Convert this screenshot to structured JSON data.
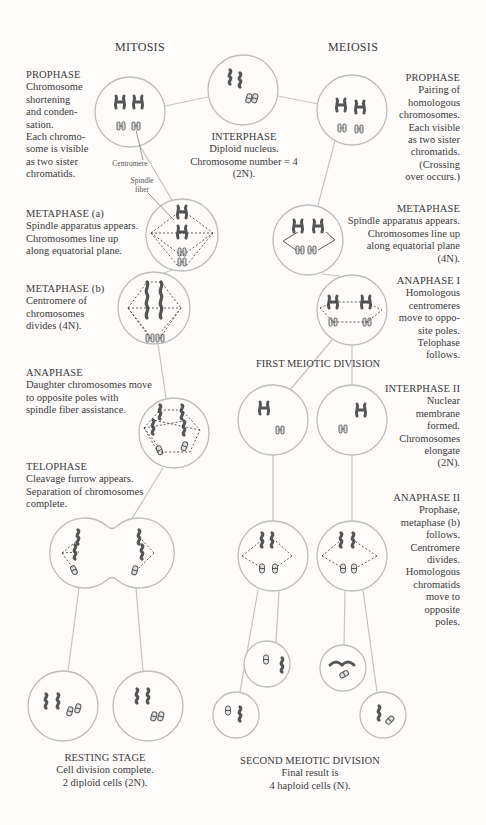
{
  "titles": {
    "mitosis": "MITOSIS",
    "meiosis": "MEIOSIS"
  },
  "interphase": {
    "heading": "INTERPHASE",
    "lines": [
      "Diploid nucleus.",
      "Chromosome number = 4",
      "(2N)."
    ]
  },
  "mitosis": {
    "prophase": {
      "heading": "PROPHASE",
      "lines": [
        "Chromosome",
        "shortening",
        "and conden-",
        "sation.",
        "Each chromo-",
        "some is visible",
        "as two sister",
        "chromatids."
      ]
    },
    "labels": {
      "centromere": "Centromere",
      "spindle_1": "Spindle",
      "spindle_2": "fiber"
    },
    "metaphase_a": {
      "heading": "METAPHASE (a)",
      "lines": [
        "Spindle apparatus appears.",
        "Chromosomes line up",
        "along equatorial plane."
      ]
    },
    "metaphase_b": {
      "heading": "METAPHASE (b)",
      "lines": [
        "Centromere of",
        "chromosomes",
        "divides (4N)."
      ]
    },
    "anaphase": {
      "heading": "ANAPHASE",
      "lines": [
        "Daughter chromosomes move",
        "to opposite poles with",
        "spindle fiber assistance."
      ]
    },
    "telophase": {
      "heading": "TELOPHASE",
      "lines": [
        "Cleavage furrow appears.",
        "Separation of chromosomes",
        "complete."
      ]
    },
    "resting": {
      "heading": "RESTING STAGE",
      "lines": [
        "Cell division complete.",
        "2 diploid cells (2N)."
      ]
    }
  },
  "meiosis": {
    "prophase": {
      "heading": "PROPHASE",
      "lines": [
        "Pairing of",
        "homologous",
        "chromosomes.",
        "Each visible",
        "as two sister",
        "chromatids.",
        "(Crossing",
        "over occurs.)"
      ]
    },
    "metaphase": {
      "heading": "METAPHASE",
      "lines": [
        "Spindle apparatus appears.",
        "Chromosomes line up",
        "along equatorial plane",
        "(4N)."
      ]
    },
    "anaphase_1": {
      "heading": "ANAPHASE I",
      "lines": [
        "Homologous",
        "centromeres",
        "move to oppo-",
        "site poles.",
        "Telophase",
        "follows."
      ]
    },
    "first_division": "FIRST MEIOTIC DIVISION",
    "interphase_2": {
      "heading": "INTERPHASE II",
      "lines": [
        "Nuclear",
        "membrane",
        "formed.",
        "Chromosomes",
        "elongate",
        "(2N)."
      ]
    },
    "anaphase_2": {
      "heading": "ANAPHASE II",
      "lines": [
        "Prophase,",
        "metaphase (b)",
        "follows.",
        "Centromere",
        "divides.",
        "Homologous",
        "chromatids",
        "move to",
        "opposite",
        "poles."
      ]
    },
    "second_division": {
      "heading": "SECOND MEIOTIC DIVISION",
      "lines": [
        "Final result is",
        "4 haploid cells (N)."
      ]
    }
  },
  "colors": {
    "outline": "#bdbdbd",
    "chromosome": "#555555",
    "text": "#3a3a3a",
    "background": "#fdfcfa"
  }
}
